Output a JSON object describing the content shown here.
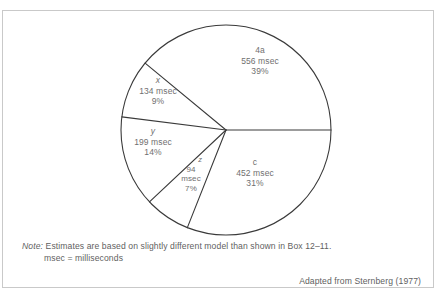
{
  "figure": {
    "note_prefix": "Note:",
    "note_line_1": "Estimates are based on slightly different model than shown in Box 12–11.",
    "note_line_2": "msec  =  milliseconds",
    "attribution": "Adapted from Sternberg (1977)"
  },
  "chart_data": {
    "type": "pie",
    "title": "",
    "xlabel": "",
    "ylabel": "",
    "units": "msec",
    "total_msec": 1435,
    "legend": "none",
    "grid": false,
    "start_angle_deg": 0,
    "direction": "clockwise",
    "center": {
      "x": 226,
      "y": 130
    },
    "radius": 105,
    "stroke_color": "#3a3a3a",
    "fill_color": "#ffffff",
    "label_color": "#707070",
    "categories": [
      "c",
      "z",
      "y",
      "x",
      "4a"
    ],
    "values": [
      452,
      94,
      199,
      134,
      556
    ],
    "percentages": [
      31,
      7,
      14,
      9,
      39
    ],
    "slices": [
      {
        "name": "c",
        "label": "c",
        "italic_label": false,
        "value_msec": 452,
        "value_text": "452 msec",
        "percent": 31,
        "percent_text": "31%",
        "start_deg": 0,
        "sweep_deg": 111.6
      },
      {
        "name": "z",
        "label": "z",
        "italic_label": true,
        "value_msec": 94,
        "value_text_line_1": "94",
        "value_text_line_2": "msec",
        "percent": 7,
        "percent_text": "7%",
        "start_deg": 111.6,
        "sweep_deg": 25.2
      },
      {
        "name": "y",
        "label": "y",
        "italic_label": true,
        "value_msec": 199,
        "value_text": "199 msec",
        "percent": 14,
        "percent_text": "14%",
        "start_deg": 136.8,
        "sweep_deg": 50.4
      },
      {
        "name": "x",
        "label": "x",
        "italic_label": true,
        "value_msec": 134,
        "value_text": "134 msec",
        "percent": 9,
        "percent_text": "9%",
        "start_deg": 187.2,
        "sweep_deg": 32.4
      },
      {
        "name": "4a",
        "label": "4a",
        "italic_label": false,
        "value_msec": 556,
        "value_text": "556 msec",
        "percent": 39,
        "percent_text": "39%",
        "start_deg": 219.6,
        "sweep_deg": 140.4
      }
    ]
  }
}
